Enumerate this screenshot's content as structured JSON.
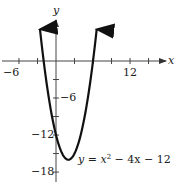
{
  "chart_data": {
    "type": "line",
    "title": "",
    "function": "y = x^2 - 4x - 12",
    "annotation": "y = x² − 4x − 12",
    "xlabel": "x",
    "ylabel": "y",
    "x_tick_labels": [
      {
        "value": -6,
        "label": "−6"
      },
      {
        "value": 12,
        "label": "12"
      }
    ],
    "y_tick_labels": [
      {
        "value": -6,
        "label": "−6"
      },
      {
        "value": -12,
        "label": "−12"
      },
      {
        "value": -18,
        "label": "−18"
      }
    ],
    "x_ticks": [
      -6,
      -3,
      3,
      6,
      9,
      12,
      15
    ],
    "y_ticks": [
      -3,
      -6,
      -9,
      -12,
      -15,
      -18
    ],
    "xlim": [
      -9,
      18
    ],
    "ylim": [
      -19,
      7
    ],
    "grid": false,
    "vertex": {
      "x": 2,
      "y": -16
    },
    "x_intercepts": [
      -2,
      6
    ],
    "y_intercept": -12,
    "series": [
      {
        "name": "y = x^2 - 4x - 12",
        "x": [
          -2.6,
          -2,
          -1,
          0,
          1,
          2,
          3,
          4,
          5,
          6,
          6.6
        ],
        "y": [
          7.16,
          0,
          -7,
          -12,
          -15,
          -16,
          -15,
          -12,
          -7,
          0,
          7.16
        ]
      }
    ]
  },
  "labels": {
    "x_axis": "x",
    "y_axis": "y",
    "x_neg6": "−6",
    "x_12": "12",
    "y_neg6": "−6",
    "y_neg12": "−12",
    "y_neg18": "−18",
    "equation_prefix": "y = x",
    "equation_sup": "2",
    "equation_suffix": " − 4x − 12"
  }
}
